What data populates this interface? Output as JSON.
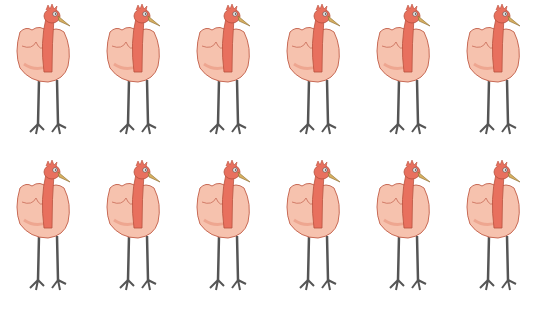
{
  "image": {
    "description": "Illustration grid of 12 identical cartoon turkey-like birds with pink bodies, red necks, and long grey legs",
    "rows": 2,
    "columns": 6,
    "colors": {
      "background": "#ffffff",
      "body": "#f6c2ae",
      "body_shade": "#eea690",
      "outline": "#c86a55",
      "neck": "#e8705e",
      "beak": "#d8b060",
      "legs": "#555555"
    }
  },
  "birds": [
    {
      "x": 12,
      "y": 2
    },
    {
      "x": 102,
      "y": 2
    },
    {
      "x": 192,
      "y": 2
    },
    {
      "x": 282,
      "y": 2
    },
    {
      "x": 372,
      "y": 2
    },
    {
      "x": 462,
      "y": 2
    },
    {
      "x": 12,
      "y": 158
    },
    {
      "x": 102,
      "y": 158
    },
    {
      "x": 192,
      "y": 158
    },
    {
      "x": 282,
      "y": 158
    },
    {
      "x": 372,
      "y": 158
    },
    {
      "x": 462,
      "y": 158
    }
  ]
}
